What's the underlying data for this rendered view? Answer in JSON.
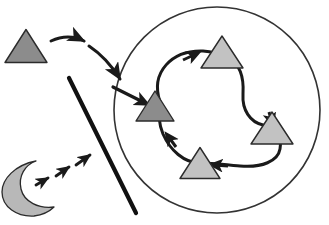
{
  "figure": {
    "title": "",
    "background_color": "#ffffff",
    "width": 329,
    "height": 225
  },
  "palette": {
    "outline": "#2b2b2b",
    "dark_triangle_fill": "#8c8c8c",
    "light_triangle_fill": "#c2c2c2",
    "moon_fill": "#b8b8b8",
    "stroke_thin": "#333333",
    "stroke_thick": "#111111",
    "arrow_color": "#1a1a1a"
  },
  "shapes": {
    "boundary_circle": {
      "name": "boundary-circle",
      "cx": 217,
      "cy": 110,
      "rx": 103,
      "ry": 103,
      "fill": "none",
      "stroke": "#333333",
      "stroke_width": 1.6
    },
    "barrier_line": {
      "name": "barrier-line",
      "x1": 69,
      "y1": 78,
      "x2": 136,
      "y2": 213,
      "stroke": "#111111",
      "stroke_width": 4.2
    },
    "tour_path": {
      "name": "closed-tour-path",
      "d": "M 160 102 C 150 72, 172 50, 203 51 C 216 52, 222 55, 228 58 C 240 64, 244 78, 243 94 C 242 110, 250 122, 263 125 C 276 128, 282 137, 280 149 C 278 161, 262 168, 240 166 C 218 164, 208 163, 200 163 C 184 163, 170 150, 163 134 C 159 124, 158 112, 160 102 Z",
      "stroke": "#1a1a1a",
      "stroke_width": 3.0,
      "fill": "none"
    },
    "entry_arrow": {
      "name": "entry-arrow",
      "d": "M 112 88 L 152 107",
      "stroke_width": 3.2
    },
    "curved_arrow_top": {
      "name": "curved-arrow-outside-top",
      "d": "M 37 44 C 55 36, 70 36, 84 41",
      "stroke_width": 3.0
    },
    "curved_arrow_descend": {
      "name": "curved-arrow-outside-descending",
      "d": "M 87 46 C 101 54, 112 66, 121 80",
      "stroke_width": 3.0
    },
    "dashed_arrow_segments": [
      {
        "name": "dashed-arrow-segment-1",
        "x1": 36,
        "y1": 184,
        "x2": 49,
        "y2": 178
      },
      {
        "name": "dashed-arrow-segment-2",
        "x1": 55,
        "y1": 176,
        "x2": 70,
        "y2": 167
      },
      {
        "name": "dashed-arrow-segment-3",
        "x1": 75,
        "y1": 165,
        "x2": 92,
        "y2": 155
      }
    ]
  },
  "agents": [
    {
      "id": "triangle-outside-start",
      "label": "triangle-outside-start",
      "cx": 26,
      "cy": 46,
      "half_width": 21,
      "height": 33,
      "fill": "#8c8c8c",
      "tone": "dark",
      "region": "outside"
    },
    {
      "id": "triangle-inside-entry",
      "label": "triangle-inside-entry",
      "cx": 155,
      "cy": 106,
      "half_width": 19,
      "height": 30,
      "fill": "#8c8c8c",
      "tone": "dark",
      "region": "inside"
    },
    {
      "id": "triangle-inside-top",
      "label": "triangle-inside-top",
      "cx": 222,
      "cy": 52,
      "half_width": 21,
      "height": 32,
      "fill": "#c2c2c2",
      "tone": "light",
      "region": "inside"
    },
    {
      "id": "triangle-inside-right",
      "label": "triangle-inside-right",
      "cx": 272,
      "cy": 128,
      "half_width": 21,
      "height": 32,
      "fill": "#c2c2c2",
      "tone": "light",
      "region": "inside"
    },
    {
      "id": "triangle-inside-bottom",
      "label": "triangle-inside-bottom",
      "cx": 200,
      "cy": 163,
      "half_width": 20,
      "height": 31,
      "fill": "#c2c2c2",
      "tone": "light",
      "region": "inside"
    }
  ],
  "moon": {
    "id": "crescent-moon",
    "label": "crescent-moon-shape",
    "fill": "#b8b8b8",
    "stroke": "#2b2b2b",
    "cx": 26,
    "cy": 188,
    "r": 26
  }
}
